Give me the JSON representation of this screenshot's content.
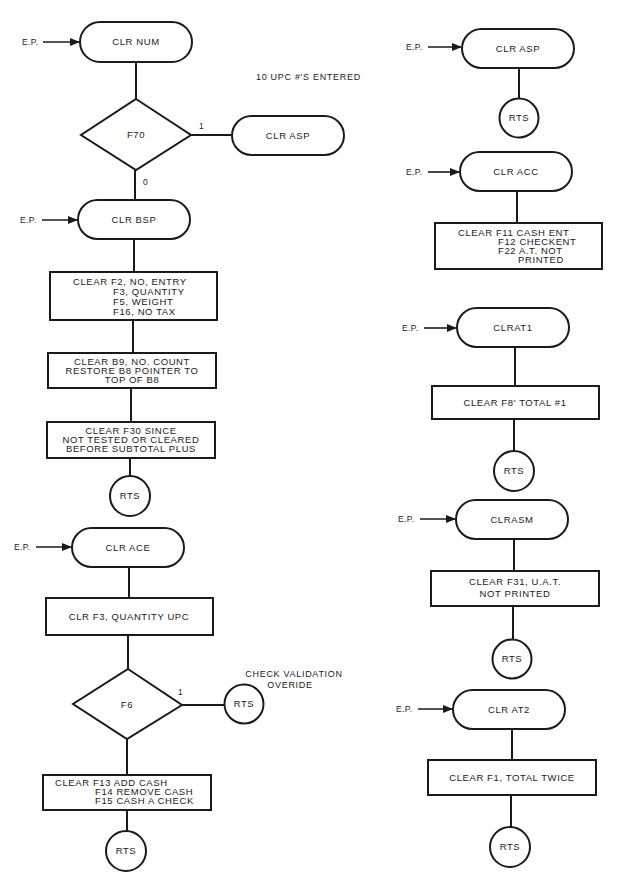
{
  "diagram": {
    "entry_label": "E.P.",
    "left_column": {
      "clr_num": {
        "title": "CLR NUM"
      },
      "note_upc": "10 UPC #'S ENTERED",
      "decision_f70": {
        "label": "F70",
        "yes": "1",
        "no": "0",
        "yes_target": "CLR ASP"
      },
      "clr_bsp": {
        "title": "CLR BSP",
        "box1": [
          "CLEAR F2, NO, ENTRY",
          "F3, QUANTITY",
          "F5, WEIGHT",
          "F16, NO TAX"
        ],
        "box2": [
          "CLEAR B9, NO. COUNT",
          "RESTORE B8 POINTER TO",
          "TOP OF B8"
        ],
        "box3": [
          "CLEAR F30 SINCE",
          "NOT TESTED OR CLEARED",
          "BEFORE SUBTOTAL PLUS"
        ],
        "end": "RTS"
      },
      "clr_ace": {
        "title": "CLR ACE",
        "box1": "CLR F3, QUANTITY UPC",
        "decision_f6": {
          "label": "F6",
          "yes": "1",
          "yes_target": "RTS",
          "note": [
            "CHECK VALIDATION",
            "OVERIDE"
          ]
        },
        "box2": [
          "CLEAR F13 ADD CASH",
          "F14 REMOVE CASH",
          "F15 CASH A CHECK"
        ],
        "end": "RTS"
      }
    },
    "right_column": {
      "clr_asp": {
        "title": "CLR ASP",
        "end": "RTS"
      },
      "clr_acc": {
        "title": "CLR ACC",
        "box": [
          "CLEAR F11 CASH ENT",
          "F12 CHECKENT",
          "F22 A.T. NOT",
          "PRINTED"
        ]
      },
      "clrat1": {
        "title": "CLRAT1",
        "box": "CLEAR F8' TOTAL #1",
        "end": "RTS"
      },
      "clrasm": {
        "title": "CLRASM",
        "box": [
          "CLEAR F31, U.A.T.",
          "NOT PRINTED"
        ],
        "end": "RTS"
      },
      "clr_at2": {
        "title": "CLR AT2",
        "box": "CLEAR F1, TOTAL TWICE",
        "end": "RTS"
      }
    },
    "colors": {
      "ink": "#1a1a1a",
      "paper": "#ffffff"
    }
  }
}
